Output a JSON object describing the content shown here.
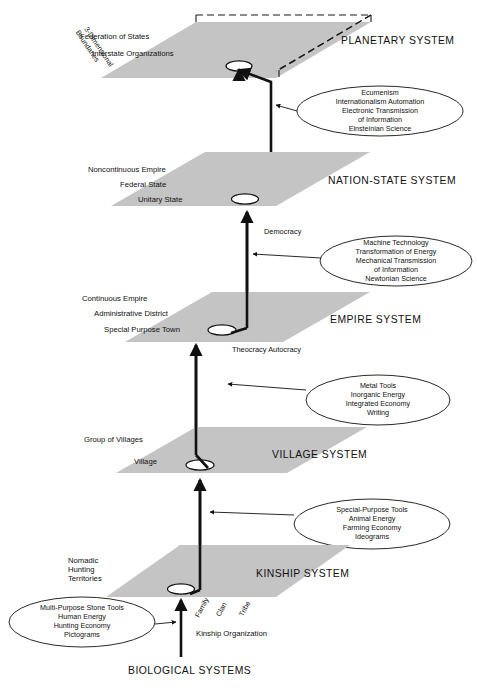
{
  "diagram": {
    "title_text_present": false,
    "colors": {
      "plane_fill": "#c4c4c4",
      "stroke": "#111111",
      "background": "#ffffff"
    },
    "systems": [
      {
        "id": "planetary",
        "system_label": "PLANETARY SYSTEM",
        "levels": [
          "Federation of States",
          "Interstate Organizations"
        ],
        "side_note": [
          "3-Dimensional",
          "Boundaries"
        ]
      },
      {
        "id": "nation-state",
        "system_label": "NATION-STATE SYSTEM",
        "levels": [
          "Noncontinuous Empire",
          "Federal State",
          "Unitary State"
        ]
      },
      {
        "id": "empire",
        "system_label": "EMPIRE SYSTEM",
        "levels": [
          "Continuous Empire",
          "Administrative District",
          "Special Purpose Town"
        ]
      },
      {
        "id": "village",
        "system_label": "VILLAGE SYSTEM",
        "levels": [
          "Group of Villages",
          "Village"
        ]
      },
      {
        "id": "kinship",
        "system_label": "KINSHIP SYSTEM",
        "levels": [
          "Nomadic",
          "Hunting",
          "Territories"
        ],
        "organization_label": "Kinship Organization",
        "organization_units": [
          "Family",
          "Clan",
          "Tribe"
        ]
      }
    ],
    "base_label": "BIOLOGICAL SYSTEMS",
    "transitions": [
      {
        "id": "empire-to-nation",
        "label": "Democracy"
      },
      {
        "id": "village-to-empire",
        "label": "Theocracy Autocracy"
      }
    ],
    "callouts": [
      {
        "id": "callout-planetary",
        "lines": [
          "Ecumenism",
          "Internationalism      Automation",
          "Electronic Transmission",
          "of Information",
          "Einsteinian Science"
        ]
      },
      {
        "id": "callout-nation-state",
        "lines": [
          "Machine Technology",
          "Transformation of Energy",
          "Mechanical Transmission",
          "of Information",
          "Newtonian Science"
        ]
      },
      {
        "id": "callout-empire",
        "lines": [
          "Metal Tools",
          "Inorganic Energy",
          "Integrated Economy",
          "Writing"
        ]
      },
      {
        "id": "callout-village",
        "lines": [
          "Special-Purpose Tools",
          "Animal Energy",
          "Farming Economy",
          "Ideograms"
        ]
      },
      {
        "id": "callout-kinship",
        "lines": [
          "Multi-Purpose Stone Tools",
          "Human Energy",
          "Hunting Economy",
          "Pictograms"
        ]
      }
    ]
  }
}
